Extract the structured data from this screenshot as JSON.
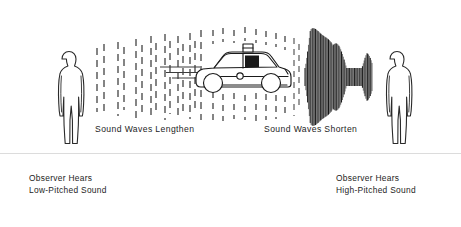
{
  "figure": {
    "title_alt": "Doppler Effect Diagram",
    "background_color": "#ffffff",
    "ink_color": "#1a1a1a",
    "ground_line_color": "#d8d8d8"
  },
  "captions": {
    "left_waves": "Sound Waves Lengthen",
    "right_waves": "Sound Waves Shorten"
  },
  "observers": {
    "left": {
      "line1": "Observer Hears",
      "line2": "Low-Pitched Sound",
      "icon": "person-silhouette-icon"
    },
    "right": {
      "line1": "Observer Hears",
      "line2": "High-Pitched Sound",
      "icon": "person-silhouette-icon"
    }
  },
  "source": {
    "icon": "police-car-icon",
    "direction": "left",
    "roof_light": "siren-light-icon"
  },
  "wavefields": {
    "left": {
      "style": "dashed",
      "description": "sparse widely spaced dashed vertical lines",
      "column_count": 11,
      "spacing_px": [
        14,
        13,
        13,
        12,
        11,
        10,
        9,
        8,
        7,
        6,
        6
      ]
    },
    "right": {
      "style": "solid",
      "description": "dense bundle of closely spaced solid vertical lines with hourglass envelope",
      "column_count": 78,
      "spacing_px": 1.35
    }
  }
}
